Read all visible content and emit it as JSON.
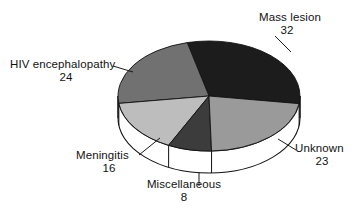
{
  "chart_data": {
    "type": "pie",
    "title": "",
    "subtitle": "",
    "xlabel": "",
    "ylabel": "",
    "legend_position": "none",
    "grid": false,
    "three_d": true,
    "total": 103,
    "categories": [
      "Mass lesion",
      "Unknown",
      "Miscellaneous",
      "Meningitis",
      "HIV encephalopathy"
    ],
    "values": [
      32,
      23,
      8,
      16,
      24
    ],
    "slices": [
      {
        "label": "Mass lesion",
        "value": 32,
        "value_text": "32",
        "color": "#1c1c1c",
        "percent": 31.1,
        "start_angle_deg": -8,
        "end_angle_deg": 104,
        "label_anchor": "top-right"
      },
      {
        "label": "Unknown",
        "value": 23,
        "value_text": "23",
        "color": "#9a9a9a",
        "percent": 22.3,
        "start_angle_deg": -88,
        "end_angle_deg": -8,
        "label_anchor": "bottom-right"
      },
      {
        "label": "Miscellaneous",
        "value": 8,
        "value_text": "8",
        "color": "#3c3c3c",
        "percent": 7.8,
        "start_angle_deg": -116,
        "end_angle_deg": -88,
        "label_anchor": "bottom-center"
      },
      {
        "label": "Meningitis",
        "value": 16,
        "value_text": "16",
        "color": "#bdbdbd",
        "percent": 15.5,
        "start_angle_deg": -172,
        "end_angle_deg": -116,
        "label_anchor": "bottom-left"
      },
      {
        "label": "HIV encephalopathy",
        "value": 24,
        "value_text": "24",
        "color": "#717171",
        "percent": 23.3,
        "start_angle_deg": 104,
        "end_angle_deg": 188,
        "label_anchor": "top-left"
      }
    ],
    "style": {
      "background": "#ffffff",
      "outline_color": "#000000",
      "side_wall_color": "#ffffff",
      "leader_line_color": "#1a1a1a",
      "center_x": 209,
      "center_y": 96,
      "radius_x": 91,
      "radius_y": 55,
      "depth": 22
    }
  },
  "labels": {
    "mass_lesion": {
      "name": "Mass lesion",
      "value": "32"
    },
    "unknown": {
      "name": "Unknown",
      "value": "23"
    },
    "miscellaneous": {
      "name": "Miscellaneous",
      "value": "8"
    },
    "meningitis": {
      "name": "Meningitis",
      "value": "16"
    },
    "hiv_encephalopathy": {
      "name": "HIV encephalopathy",
      "value": "24"
    }
  }
}
